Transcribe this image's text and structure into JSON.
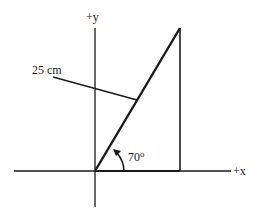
{
  "diagram": {
    "type": "vector-triangle",
    "labels": {
      "y_axis": "+y",
      "x_axis": "+x",
      "length": "25 cm",
      "angle": "70",
      "angle_unit": "o"
    },
    "values": {
      "hypotenuse_length_cm": 25,
      "angle_deg": 70
    },
    "colors": {
      "line": "#1a1a1a",
      "background": "#ffffff"
    }
  }
}
